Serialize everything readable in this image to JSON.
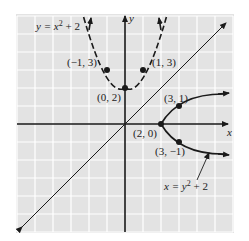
{
  "figure": {
    "type": "coordinate-plane-graph",
    "background_color": "#e3e3e3",
    "grid_color": "#ffffff",
    "axis_color": "#1a1a1a",
    "curve_color": "#1a1a1a",
    "axes": {
      "x_label": "x",
      "y_label": "y"
    },
    "curves": [
      {
        "name": "y = x^2 + 2",
        "label_prefix": "y = x",
        "label_exp": "2",
        "label_suffix": " + 2",
        "style": "dashed"
      },
      {
        "name": "x = y^2 + 2",
        "label_prefix": "x = y",
        "label_exp": "2",
        "label_suffix": " + 2",
        "style": "solid"
      },
      {
        "name": "y = x",
        "style": "solid"
      }
    ],
    "points": [
      {
        "label": "(−1, 3)",
        "x": -1,
        "y": 3
      },
      {
        "label": "(1, 3)",
        "x": 1,
        "y": 3
      },
      {
        "label": "(0, 2)",
        "x": 0,
        "y": 2
      },
      {
        "label": "(3, 1)",
        "x": 3,
        "y": 1
      },
      {
        "label": "(2, 0)",
        "x": 2,
        "y": 0
      },
      {
        "label": "(3, −1)",
        "x": 3,
        "y": -1
      }
    ]
  }
}
